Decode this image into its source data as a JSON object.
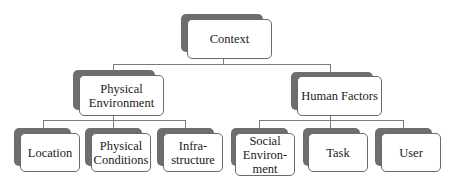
{
  "diagram": {
    "type": "hierarchy",
    "root": {
      "label": "Context",
      "children": [
        {
          "label_lines": [
            "Physical",
            "Environment"
          ],
          "children": [
            {
              "label_lines": [
                "Location"
              ]
            },
            {
              "label_lines": [
                "Physical",
                "Conditions"
              ]
            },
            {
              "label_lines": [
                "Infra-",
                "structure"
              ]
            }
          ]
        },
        {
          "label_lines": [
            "Human Factors"
          ],
          "children": [
            {
              "label_lines": [
                "Social",
                "Environ-",
                "ment"
              ]
            },
            {
              "label_lines": [
                "Task"
              ]
            },
            {
              "label_lines": [
                "User"
              ]
            }
          ]
        }
      ]
    },
    "colors": {
      "shadow": "#6e6e6e",
      "box_fill": "#ffffff",
      "box_border": "#6a6a6a",
      "connector": "#7a7a7a",
      "text": "#1a1a1a"
    }
  }
}
